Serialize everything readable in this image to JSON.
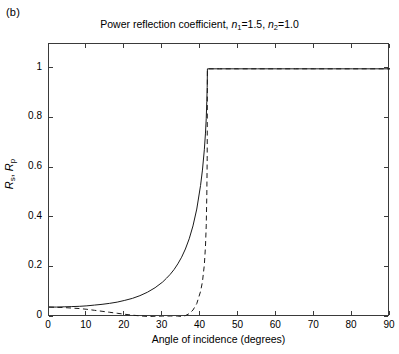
{
  "panel": {
    "label": "(b)"
  },
  "chart_data": {
    "type": "line",
    "title": "Power reflection coefficient, n1=1.5, n2=1.0",
    "title_parts": {
      "prefix": "Power reflection coefficient, ",
      "n_symbol": "n",
      "sub1": "1",
      "value1": "=1.5, ",
      "sub2": "2",
      "value2": "=1.0"
    },
    "xlabel": "Angle of incidence (degrees)",
    "ylabel": "R_s, R_p",
    "ylabel_parts": {
      "r1": "R",
      "sub1": "s",
      "sep": ", ",
      "r2": "R",
      "sub2": "p"
    },
    "xlim": [
      0,
      90
    ],
    "ylim": [
      0,
      1.1
    ],
    "xticks": [
      0,
      10,
      20,
      30,
      40,
      50,
      60,
      70,
      80,
      90
    ],
    "yticks": [
      0,
      0.2,
      0.4,
      0.6,
      0.8,
      1
    ],
    "ytick_labels": [
      "0",
      "0.2",
      "0.4",
      "0.6",
      "0.8",
      "1"
    ],
    "grid": false,
    "legend": "none",
    "brewster_angle": 33.69,
    "critical_angle": 41.81,
    "normal_incidence_reflectance": 0.04,
    "series": [
      {
        "name": "Rs",
        "style": "solid",
        "color": "#1a1a1a",
        "x": [
          0,
          2,
          4,
          6,
          8,
          10,
          12,
          14,
          16,
          18,
          20,
          22,
          24,
          26,
          28,
          30,
          31,
          32,
          33,
          34,
          35,
          36,
          37,
          38,
          39,
          40,
          40.5,
          41,
          41.3,
          41.5,
          41.65,
          41.75,
          41.81,
          42,
          45,
          50,
          55,
          60,
          65,
          70,
          75,
          80,
          85,
          90
        ],
        "y": [
          0.04,
          0.04,
          0.041,
          0.042,
          0.043,
          0.045,
          0.048,
          0.051,
          0.055,
          0.06,
          0.067,
          0.075,
          0.086,
          0.1,
          0.118,
          0.141,
          0.156,
          0.172,
          0.191,
          0.214,
          0.241,
          0.274,
          0.315,
          0.367,
          0.435,
          0.53,
          0.592,
          0.674,
          0.741,
          0.8,
          0.869,
          0.925,
          1.0,
          1.0,
          1.0,
          1.0,
          1.0,
          1.0,
          1.0,
          1.0,
          1.0,
          1.0,
          1.0,
          1.0
        ]
      },
      {
        "name": "Rp",
        "style": "dashed",
        "color": "#1a1a1a",
        "x": [
          0,
          2,
          4,
          6,
          8,
          10,
          12,
          14,
          16,
          18,
          20,
          22,
          24,
          26,
          28,
          30,
          31,
          32,
          33,
          33.69,
          34,
          35,
          36,
          37,
          38,
          39,
          40,
          40.5,
          41,
          41.3,
          41.5,
          41.65,
          41.75,
          41.81,
          42,
          45,
          50,
          55,
          60,
          65,
          70,
          75,
          80,
          85,
          90
        ],
        "y": [
          0.04,
          0.039,
          0.038,
          0.036,
          0.034,
          0.031,
          0.027,
          0.023,
          0.019,
          0.015,
          0.011,
          0.0075,
          0.0045,
          0.0023,
          0.0009,
          0.0002,
          5e-05,
          5e-06,
          0.0,
          0.0,
          0.0002,
          0.0018,
          0.0056,
          0.0135,
          0.028,
          0.054,
          0.103,
          0.142,
          0.21,
          0.285,
          0.37,
          0.49,
          0.64,
          1.0,
          1.0,
          1.0,
          1.0,
          1.0,
          1.0,
          1.0,
          1.0,
          1.0,
          1.0,
          1.0,
          1.0
        ]
      }
    ]
  }
}
